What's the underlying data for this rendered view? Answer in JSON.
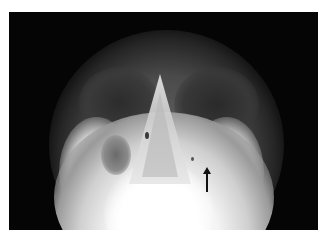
{
  "image": {
    "kind": "radiograph",
    "description": "Occipitomental (Waters view) X-ray of the paranasal sinuses",
    "annotation": {
      "type": "arrow",
      "direction": "up",
      "color": "#111111"
    },
    "colors": {
      "background": "#ffffff",
      "film": "#050505",
      "bone": "#f4f4f4"
    }
  }
}
